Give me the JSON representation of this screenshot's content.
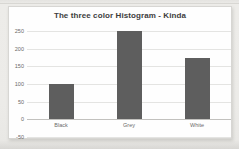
{
  "page": {
    "background_color": "#ecebe8",
    "card_color": "#fefefe",
    "card_border_color": "#d7d6d3"
  },
  "chart_data": {
    "type": "bar",
    "title": "The three color Histogram - Kinda",
    "categories": [
      "Black",
      "Grey",
      "White"
    ],
    "values": [
      100,
      250,
      175
    ],
    "xlabel": "",
    "ylabel": "",
    "ylim": [
      -50,
      250
    ],
    "yticks": [
      250,
      200,
      150,
      100,
      50,
      0,
      -50
    ],
    "grid": true,
    "legend": false,
    "bar_color": "#5e5e5e",
    "gridline_color": "#e4e4e2",
    "axis_line_color": "#c2c1be",
    "title_color": "#3d3d3d",
    "tick_label_color": "#6a6a6a"
  }
}
